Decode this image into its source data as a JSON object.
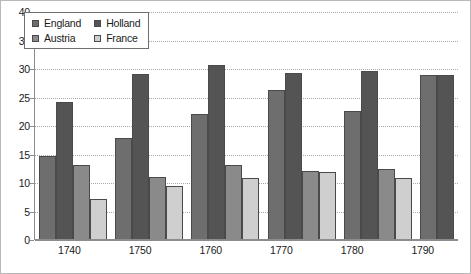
{
  "chart_data": {
    "type": "bar",
    "title": "",
    "xlabel": "",
    "ylabel": "",
    "categories": [
      "1740",
      "1750",
      "1760",
      "1770",
      "1780",
      "1790"
    ],
    "ylim": [
      0,
      40
    ],
    "yticks": [
      0,
      5,
      10,
      15,
      20,
      25,
      30,
      35,
      40
    ],
    "grid": true,
    "legend_position": "top-left-inside",
    "series": [
      {
        "name": "England",
        "color": "#6e6e6e",
        "values": [
          14.5,
          17.7,
          22.0,
          26.2,
          22.4,
          28.7
        ]
      },
      {
        "name": "Holland",
        "color": "#545454",
        "values": [
          24.0,
          29.0,
          30.5,
          29.2,
          29.5,
          28.8
        ]
      },
      {
        "name": "Austria",
        "color": "#8a8a8a",
        "values": [
          13.0,
          10.8,
          13.0,
          12.0,
          12.2,
          null
        ]
      },
      {
        "name": "France",
        "color": "#cfcfcf",
        "values": [
          7.0,
          9.3,
          10.7,
          11.8,
          10.7,
          null
        ]
      }
    ]
  },
  "legend": {
    "entries": [
      {
        "label": "England",
        "swatch": "#6e6e6e"
      },
      {
        "label": "Holland",
        "swatch": "#545454"
      },
      {
        "label": "Austria",
        "swatch": "#8a8a8a"
      },
      {
        "label": "France",
        "swatch": "#cfcfcf"
      }
    ]
  },
  "axis": {
    "y_tick_labels": [
      "0",
      "5",
      "10",
      "15",
      "20",
      "25",
      "30",
      "35",
      "40"
    ],
    "x_tick_labels": [
      "1740",
      "1750",
      "1760",
      "1770",
      "1780",
      "1790"
    ]
  }
}
